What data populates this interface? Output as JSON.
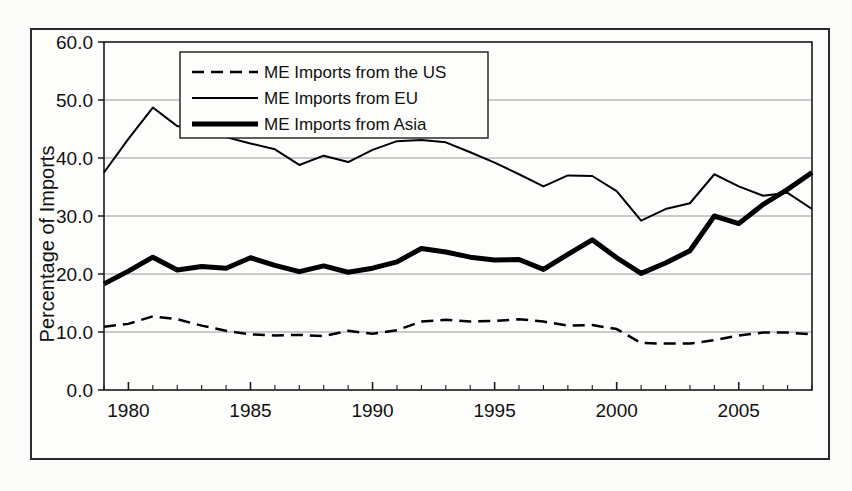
{
  "chart_data": {
    "type": "line",
    "title": "",
    "subtitle": "",
    "xlabel": "",
    "ylabel": "Percentage of Imports",
    "xlim": [
      1979,
      2008
    ],
    "ylim": [
      0.0,
      60.0
    ],
    "ytick_labels": [
      "0.0",
      "10.0",
      "20.0",
      "30.0",
      "40.0",
      "50.0",
      "60.0"
    ],
    "ytick_values": [
      0.0,
      10.0,
      20.0,
      30.0,
      40.0,
      50.0,
      60.0
    ],
    "xtick_labels": [
      "1980",
      "1985",
      "1990",
      "1995",
      "2000",
      "2005"
    ],
    "xtick_values": [
      1980,
      1985,
      1990,
      1995,
      2000,
      2005
    ],
    "x_minor_ticks_every": 1,
    "grid": "horizontal",
    "legend_position": "top-left-inside",
    "x": [
      1979,
      1980,
      1981,
      1982,
      1983,
      1984,
      1985,
      1986,
      1987,
      1988,
      1989,
      1990,
      1991,
      1992,
      1993,
      1994,
      1995,
      1996,
      1997,
      1998,
      1999,
      2000,
      2001,
      2002,
      2003,
      2004,
      2005,
      2006,
      2007,
      2008
    ],
    "series": [
      {
        "name": "ME Imports from the US",
        "style": "dashed",
        "color": "#000000",
        "width": 2.5,
        "values": [
          10.9,
          11.4,
          12.7,
          12.2,
          11.1,
          10.2,
          9.6,
          9.4,
          9.5,
          9.3,
          10.2,
          9.7,
          10.3,
          11.8,
          12.1,
          11.8,
          11.9,
          12.2,
          11.8,
          11.1,
          11.2,
          10.5,
          8.1,
          8.0,
          8.0,
          8.6,
          9.4,
          9.9,
          9.9,
          9.6
        ]
      },
      {
        "name": "ME Imports from EU",
        "style": "solid",
        "color": "#000000",
        "width": 2,
        "values": [
          37.5,
          43.3,
          48.7,
          45.5,
          44.6,
          43.6,
          42.5,
          41.5,
          38.8,
          40.4,
          39.3,
          41.4,
          42.9,
          43.1,
          42.7,
          41.0,
          39.2,
          37.2,
          35.1,
          37.0,
          36.9,
          34.3,
          29.2,
          31.2,
          32.2,
          37.2,
          35.1,
          33.5,
          34.0,
          31.2
        ]
      },
      {
        "name": "ME Imports from Asia",
        "style": "solid-thick",
        "color": "#000000",
        "width": 5,
        "values": [
          18.3,
          20.5,
          22.9,
          20.7,
          21.3,
          21.0,
          22.8,
          21.5,
          20.4,
          21.4,
          20.3,
          21.0,
          22.1,
          24.4,
          23.8,
          22.9,
          22.4,
          22.5,
          20.8,
          23.4,
          25.9,
          22.8,
          20.1,
          21.9,
          24.0,
          30.0,
          28.7,
          32.0,
          34.6,
          37.5
        ]
      }
    ]
  },
  "axis": {
    "ylabel": "Percentage of Imports"
  },
  "legend": {
    "items": [
      {
        "label": "ME Imports from the US",
        "style": "dashed"
      },
      {
        "label": "ME Imports from EU",
        "style": "solid"
      },
      {
        "label": "ME Imports from Asia",
        "style": "solid-thick"
      }
    ]
  }
}
